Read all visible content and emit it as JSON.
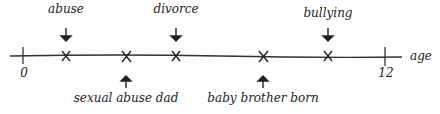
{
  "timeline": {
    "axis_label": "age",
    "start_label": "0",
    "end_label": "12",
    "events_above": [
      {
        "label": "abuse",
        "x": 66
      },
      {
        "label": "divorce",
        "x": 176
      },
      {
        "label": "bullying",
        "x": 328
      }
    ],
    "events_below": [
      {
        "label": "sexual abuse dad",
        "x": 126
      },
      {
        "label": "baby brother born",
        "x": 263
      }
    ]
  }
}
